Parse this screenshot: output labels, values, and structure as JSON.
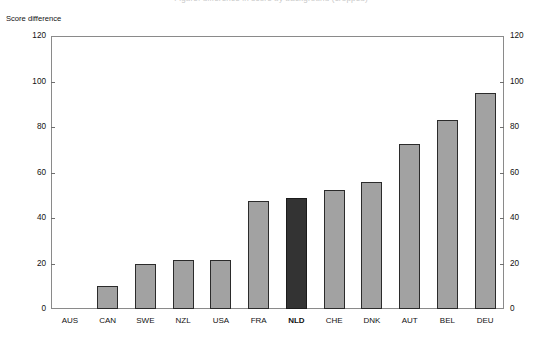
{
  "chart": {
    "title_cropped": "Figure: difference in score by background (cropped)",
    "y_axis_title": "Score difference"
  },
  "chart_data": {
    "type": "bar",
    "title": "",
    "xlabel": "",
    "ylabel": "Score difference",
    "ylim": [
      0,
      120
    ],
    "yticks": [
      0,
      20,
      40,
      60,
      80,
      100,
      120
    ],
    "ytick_labels": [
      "0",
      "20",
      "40",
      "60",
      "80",
      "100",
      "120"
    ],
    "grid": false,
    "legend": null,
    "dual_axis": true,
    "right_axis_labels": [
      "0",
      "20",
      "40",
      "60",
      "80",
      "100",
      "120"
    ],
    "categories": [
      "AUS",
      "CAN",
      "SWE",
      "NZL",
      "USA",
      "FRA",
      "NLD",
      "CHE",
      "DNK",
      "AUT",
      "BEL",
      "DEU"
    ],
    "values": [
      0,
      10,
      20,
      21.5,
      21.5,
      47.5,
      49,
      52.5,
      56,
      72.5,
      83,
      95
    ],
    "highlight_category": "NLD",
    "colors": {
      "bar": "#a2a2a2",
      "bar_border": "#2b2b2b",
      "highlight_bar": "#333333",
      "axis": "#8a8a8a",
      "text": "#111111"
    }
  }
}
